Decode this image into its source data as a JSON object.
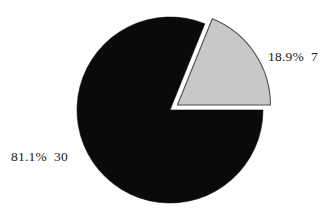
{
  "chart_data": {
    "type": "pie",
    "title": "",
    "subtitle": "",
    "xlabel": "",
    "ylabel": "",
    "grid": false,
    "legend_position": "none",
    "total": 37,
    "start_angle_deg": 0,
    "direction": "counterclockwise",
    "background_color": "#ffffff",
    "categories": [
      "30",
      "7"
    ],
    "values": [
      30,
      7
    ],
    "percentages": [
      81.1,
      18.9
    ],
    "slices": [
      {
        "name": "slice-black",
        "count": 30,
        "percent": 81.1,
        "label": "81.1%  30",
        "percent_text": "81.1%",
        "count_text": "30",
        "color": "#0a0a0a",
        "stroke": "#0a0a0a",
        "exploded": false,
        "explode_offset_px": 0,
        "start_angle_deg": 68,
        "end_angle_deg": 360,
        "sweep_deg": 292,
        "label_side": "left"
      },
      {
        "name": "slice-gray",
        "count": 7,
        "percent": 18.9,
        "label": "18.9%  7",
        "percent_text": "18.9%",
        "count_text": "7",
        "color": "#c8c8c8",
        "stroke": "#4d4d4d",
        "exploded": true,
        "explode_offset_px": 9,
        "start_angle_deg": 0,
        "end_angle_deg": 68,
        "sweep_deg": 68,
        "label_side": "right"
      }
    ],
    "geometry": {
      "center_x": 170,
      "center_y": 110,
      "radius": 93
    }
  },
  "labels": {
    "gray_slice": "18.9%  7",
    "black_slice": "81.1%  30"
  },
  "colors": {
    "background": "#ffffff",
    "slice_black": "#0a0a0a",
    "slice_gray": "#c8c8c8",
    "slice_gray_outline": "#4d4d4d",
    "text": "#1a1a1a"
  }
}
